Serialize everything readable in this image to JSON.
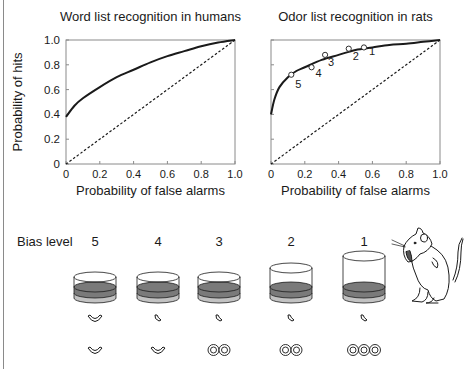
{
  "chart_data": [
    {
      "type": "line",
      "title": "Word list recognition in humans",
      "xlabel": "Probability of false alarms",
      "ylabel": "Probability of hits",
      "xlim": [
        0,
        1.0
      ],
      "ylim": [
        0,
        1.0
      ],
      "x_ticks": [
        "0",
        "0.2",
        "0.4",
        "0.6",
        "0.8",
        "1.0"
      ],
      "y_ticks": [
        "0",
        "0.2",
        "0.4",
        "0.6",
        "0.8",
        "1.0"
      ],
      "grid": false,
      "series": [
        {
          "name": "ROC curve",
          "style": "solid",
          "x": [
            0,
            0.05,
            0.1,
            0.2,
            0.3,
            0.4,
            0.5,
            0.6,
            0.7,
            0.8,
            0.9,
            1.0
          ],
          "y": [
            0.38,
            0.47,
            0.53,
            0.62,
            0.7,
            0.76,
            0.82,
            0.87,
            0.91,
            0.95,
            0.98,
            1.0
          ]
        },
        {
          "name": "Chance diagonal",
          "style": "dotted",
          "x": [
            0,
            1.0
          ],
          "y": [
            0,
            1.0
          ]
        }
      ]
    },
    {
      "type": "line",
      "title": "Odor list recognition in rats",
      "xlabel": "Probability of false alarms",
      "ylabel": "",
      "xlim": [
        0,
        1.0
      ],
      "ylim": [
        0,
        1.0
      ],
      "x_ticks": [
        "0",
        "0.2",
        "0.4",
        "0.6",
        "0.8",
        "1.0"
      ],
      "y_ticks": [],
      "grid": false,
      "series": [
        {
          "name": "Fitted ROC curve",
          "style": "solid",
          "x": [
            0,
            0.02,
            0.05,
            0.1,
            0.15,
            0.2,
            0.3,
            0.4,
            0.5,
            0.6,
            0.7,
            0.8,
            0.9,
            1.0
          ],
          "y": [
            0.4,
            0.52,
            0.62,
            0.7,
            0.75,
            0.78,
            0.84,
            0.88,
            0.92,
            0.94,
            0.96,
            0.97,
            0.985,
            1.0
          ]
        },
        {
          "name": "Chance diagonal",
          "style": "dotted",
          "x": [
            0,
            1.0
          ],
          "y": [
            0,
            1.0
          ]
        },
        {
          "name": "Observed bias levels",
          "style": "open-circle markers",
          "labels": [
            "5",
            "4",
            "3",
            "2",
            "1"
          ],
          "x": [
            0.12,
            0.24,
            0.32,
            0.46,
            0.55
          ],
          "y": [
            0.72,
            0.78,
            0.88,
            0.93,
            0.94
          ]
        }
      ]
    }
  ],
  "bias_panel": {
    "label": "Bias level",
    "levels": [
      {
        "level": "5",
        "cup_height": "short",
        "reward_row1": "large-cereal-piece",
        "reward_row2": "large-cereal-piece"
      },
      {
        "level": "4",
        "cup_height": "short",
        "reward_row1": "small-cereal-piece",
        "reward_row2": "large-cereal-piece"
      },
      {
        "level": "3",
        "cup_height": "short",
        "reward_row1": "small-cereal-piece",
        "reward_row2": "2 cereal rings"
      },
      {
        "level": "2",
        "cup_height": "medium",
        "reward_row1": "small-cereal-piece",
        "reward_row2": "2 cereal rings"
      },
      {
        "level": "1",
        "cup_height": "tall",
        "reward_row1": "small-cereal-piece",
        "reward_row2": "3 cereal rings"
      }
    ]
  },
  "colors": {
    "ink": "#1a1a1a",
    "axis": "#8a8a8a",
    "sand_dark": "#7a7a7a",
    "sand_light": "#c2c2c2"
  }
}
